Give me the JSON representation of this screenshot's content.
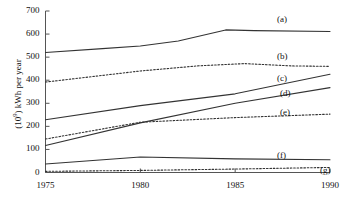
{
  "chart_data": {
    "type": "line",
    "title": "",
    "xlabel": "",
    "ylabel": "(10^9) kWh per year",
    "ylabel_prefix": "(10",
    "ylabel_exponent": "9",
    "ylabel_suffix": ") kWh per year",
    "x": [
      1975,
      1980,
      1985,
      1990
    ],
    "xlim": [
      1975,
      1990
    ],
    "ylim": [
      0,
      700
    ],
    "grid": false,
    "legend_position": "right-inline-labels",
    "x_tick_labels": [
      "1975",
      "1980",
      "1985",
      "1990"
    ],
    "y_tick_labels": [
      "0",
      "100",
      "200",
      "300",
      "400",
      "500",
      "600",
      "700"
    ],
    "y_ticks": [
      0,
      100,
      200,
      300,
      400,
      500,
      600,
      700
    ],
    "series": [
      {
        "name": "(a)",
        "label": "(a)",
        "style": "solid",
        "color": "#333333",
        "x": [
          1975,
          1978,
          1980,
          1982,
          1984.5,
          1986,
          1990
        ],
        "values": [
          520,
          537,
          548,
          570,
          618,
          615,
          611
        ]
      },
      {
        "name": "(b)",
        "label": "(b)",
        "style": "dotted",
        "color": "#333333",
        "x": [
          1975,
          1980,
          1983,
          1985.5,
          1988,
          1990
        ],
        "values": [
          392,
          440,
          462,
          472,
          462,
          460
        ]
      },
      {
        "name": "(c)",
        "label": "(c)",
        "style": "solid",
        "color": "#333333",
        "x": [
          1975,
          1980,
          1985,
          1990
        ],
        "values": [
          229,
          290,
          341,
          426
        ]
      },
      {
        "name": "(d)",
        "label": "(d)",
        "style": "solid",
        "color": "#333333",
        "x": [
          1975,
          1980,
          1985,
          1990
        ],
        "values": [
          117,
          215,
          300,
          368
        ]
      },
      {
        "name": "(e)",
        "label": "(e)",
        "style": "dotted",
        "color": "#333333",
        "x": [
          1975,
          1980,
          1985,
          1990
        ],
        "values": [
          145,
          218,
          238,
          253
        ]
      },
      {
        "name": "(f)",
        "label": "(f)",
        "style": "solid",
        "color": "#333333",
        "x": [
          1975,
          1980,
          1985,
          1990
        ],
        "values": [
          37,
          67,
          59,
          55
        ]
      },
      {
        "name": "(g)",
        "label": "(g)",
        "style": "dotted",
        "color": "#333333",
        "x": [
          1975,
          1980,
          1985,
          1990
        ],
        "values": [
          5,
          9,
          15,
          22
        ]
      }
    ],
    "series_label_positions": [
      {
        "label": "(a)",
        "left": 277,
        "top": 14
      },
      {
        "label": "(b)",
        "left": 277,
        "top": 51
      },
      {
        "label": "(c)",
        "left": 277,
        "top": 73
      },
      {
        "label": "(d)",
        "left": 280,
        "top": 88
      },
      {
        "label": "(e)",
        "left": 280,
        "top": 107
      },
      {
        "label": "(f)",
        "left": 277,
        "top": 150
      },
      {
        "label": "(g)",
        "left": 320,
        "top": 165
      }
    ]
  }
}
